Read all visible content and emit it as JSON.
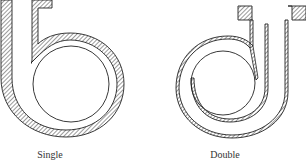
{
  "figure": {
    "panels": [
      {
        "id": "single",
        "caption": "Single",
        "description": "Single volute casing cross-section with impeller circle and hatched casing wall"
      },
      {
        "id": "double",
        "caption": "Double",
        "description": "Double volute casing cross-section with inner splitter wall and hatched casing walls"
      }
    ],
    "colors": {
      "line": "#222222",
      "hatch": "#555555",
      "background": "#ffffff"
    }
  }
}
